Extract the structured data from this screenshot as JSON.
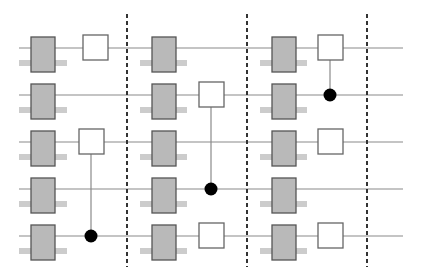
{
  "diagram": {
    "type": "quantum-circuit-layers",
    "width": 422,
    "height": 280,
    "colors": {
      "background": "#ffffff",
      "wire": "#8a8a8a",
      "barrier": "#333333",
      "layer_box_fill": "#b9b9b9",
      "layer_box_stroke": "#555555",
      "layer_bar": "#cccccc",
      "gate_fill": "#ffffff",
      "gate_stroke": "#666666",
      "control_line": "#8a8a8a",
      "control_dot": "#000000"
    },
    "wires": {
      "x_start": 19,
      "x_end": 403,
      "y": [
        48,
        95,
        142,
        189,
        236
      ]
    },
    "barriers": {
      "x": [
        127,
        247,
        367
      ],
      "y_start": 14,
      "y_end": 267,
      "dash": "4,3"
    },
    "layer_box": {
      "width": 24,
      "top_offset": -11,
      "height": 35
    },
    "layer_bar": {
      "top_offset": 12,
      "height": 6
    },
    "layers": [
      {
        "box_x": 31,
        "bar_x1": 19,
        "bar_x2": 67
      },
      {
        "box_x": 152,
        "bar_x1": 140,
        "bar_x2": 187
      },
      {
        "box_x": 272,
        "bar_x1": 260,
        "bar_x2": 307
      }
    ],
    "gate_size": 25,
    "gates": [
      {
        "x": 83,
        "wire": 0
      },
      {
        "x": 79,
        "wire": 2
      },
      {
        "x": 199,
        "wire": 1
      },
      {
        "x": 199,
        "wire": 4
      },
      {
        "x": 318,
        "wire": 0
      },
      {
        "x": 318,
        "wire": 2
      },
      {
        "x": 318,
        "wire": 4
      }
    ],
    "controls": [
      {
        "x": 91,
        "target_wire": 2,
        "control_wire": 4
      },
      {
        "x": 211,
        "target_wire": 1,
        "control_wire": 3
      },
      {
        "x": 330,
        "target_wire": 0,
        "control_wire": 1
      }
    ],
    "control_dot_radius": 6.5
  }
}
